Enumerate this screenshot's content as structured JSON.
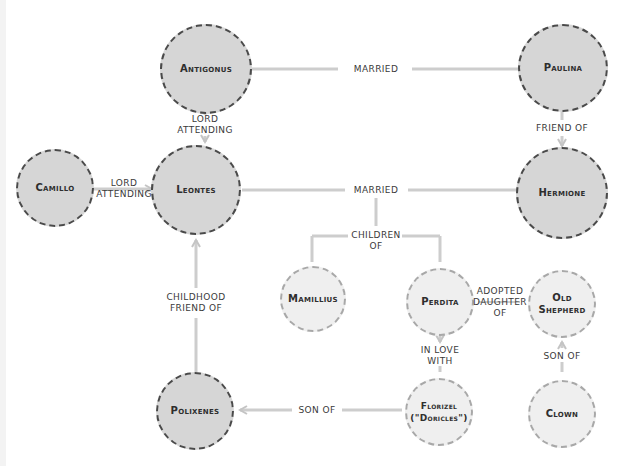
{
  "diagram": {
    "type": "character-relationship-map",
    "colors": {
      "major_fill": "#d6d6d6",
      "major_border": "#4a4a4a",
      "minor_fill": "#efefef",
      "minor_border": "#a8a8a8",
      "link": "#c8c8c8"
    },
    "nodes": {
      "antigonus": {
        "label": "Antigonus",
        "type": "major"
      },
      "paulina": {
        "label": "Paulina",
        "type": "major"
      },
      "camillo": {
        "label": "Camillo",
        "type": "major"
      },
      "leontes": {
        "label": "Leontes",
        "type": "major"
      },
      "hermione": {
        "label": "Hermione",
        "type": "major"
      },
      "mamillius": {
        "label": "Mamillius",
        "type": "minor"
      },
      "perdita": {
        "label": "Perdita",
        "type": "minor"
      },
      "old_shepherd": {
        "label": "Old\nShepherd",
        "type": "minor"
      },
      "polixenes": {
        "label": "Polixenes",
        "type": "major"
      },
      "florizel": {
        "label": "Florizel\n(\"Doricles\")",
        "type": "minor"
      },
      "clown": {
        "label": "Clown",
        "type": "minor"
      }
    },
    "edges": {
      "antigonus_paulina": {
        "from": "Antigonus",
        "to": "Paulina",
        "label": "MARRIED"
      },
      "antigonus_leontes": {
        "from": "Antigonus",
        "to": "Leontes",
        "label": "LORD\nATTENDING"
      },
      "paulina_hermione": {
        "from": "Paulina",
        "to": "Hermione",
        "label": "FRIEND OF"
      },
      "camillo_leontes": {
        "from": "Camillo",
        "to": "Leontes",
        "label": "LORD\nATTENDING"
      },
      "leontes_hermione": {
        "from": "Leontes",
        "to": "Hermione",
        "label": "MARRIED"
      },
      "children": {
        "from": "Mamillius, Perdita",
        "to": "Leontes & Hermione",
        "label": "CHILDREN\nOF"
      },
      "perdita_shepherd": {
        "from": "Perdita",
        "to": "Old Shepherd",
        "label": "ADOPTED\nDAUGHTER\nOF"
      },
      "florizel_perdita": {
        "from": "Florizel",
        "to": "Perdita",
        "label": "IN LOVE\nWITH"
      },
      "clown_shepherd": {
        "from": "Clown",
        "to": "Old Shepherd",
        "label": "SON OF"
      },
      "polixenes_leontes": {
        "from": "Polixenes",
        "to": "Leontes",
        "label": "CHILDHOOD\nFRIEND OF"
      },
      "florizel_polixenes": {
        "from": "Florizel",
        "to": "Polixenes",
        "label": "SON OF"
      }
    }
  }
}
